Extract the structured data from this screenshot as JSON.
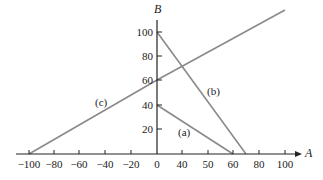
{
  "chart_data": {
    "type": "line",
    "title": "",
    "xlabel": "A",
    "ylabel": "B",
    "x_tick_labels": [
      "-100",
      "-80",
      "-60",
      "-40",
      "-20",
      "0",
      "40",
      "50",
      "60",
      "80",
      "100"
    ],
    "y_tick_labels": [
      "20",
      "40",
      "60",
      "80",
      "100"
    ],
    "grid": false,
    "legend": "inline labels",
    "series": [
      {
        "name": "(a)",
        "points": [
          [
            0,
            40
          ],
          [
            60,
            0
          ]
        ]
      },
      {
        "name": "(b)",
        "points": [
          [
            0,
            100
          ],
          [
            70,
            0
          ]
        ]
      },
      {
        "name": "(c)",
        "points": [
          [
            -100,
            0
          ],
          [
            0,
            60
          ],
          [
            100,
            120
          ]
        ]
      }
    ],
    "colors": {
      "lines": "#8a8a8a",
      "axes": "#222222"
    }
  },
  "axes": {
    "x_title": "A",
    "y_title": "B",
    "x_ticks": [
      {
        "label": "−100",
        "px": 29
      },
      {
        "label": "−80",
        "px": 54
      },
      {
        "label": "−60",
        "px": 79
      },
      {
        "label": "−40",
        "px": 105
      },
      {
        "label": "−20",
        "px": 131
      },
      {
        "label": "0",
        "px": 157
      },
      {
        "label": "40",
        "px": 182
      },
      {
        "label": "50",
        "px": 208
      },
      {
        "label": "60",
        "px": 233
      },
      {
        "label": "80",
        "px": 259
      },
      {
        "label": "100",
        "px": 285
      }
    ],
    "y_ticks": [
      {
        "label": "20",
        "py": 129
      },
      {
        "label": "40",
        "py": 105
      },
      {
        "label": "60",
        "py": 80
      },
      {
        "label": "80",
        "py": 56
      },
      {
        "label": "100",
        "py": 32
      }
    ]
  },
  "labels": {
    "a": "(a)",
    "b": "(b)",
    "c": "(c)"
  }
}
